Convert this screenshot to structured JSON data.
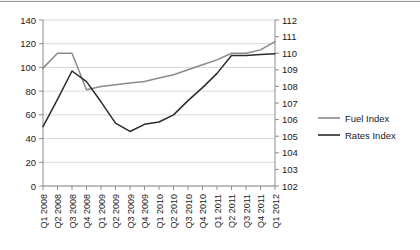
{
  "chart_data": {
    "type": "line",
    "title": "",
    "xlabel": "",
    "categories": [
      "Q1 2008",
      "Q2 2008",
      "Q3 2008",
      "Q4 2008",
      "Q1 2009",
      "Q2 2009",
      "Q3 2009",
      "Q4 2009",
      "Q1 2010",
      "Q2 2010",
      "Q3 2010",
      "Q4 2010",
      "Q1 2011",
      "Q2 2011",
      "Q3 2011",
      "Q4 2011",
      "Q1 2012"
    ],
    "grid": true,
    "legend_position": "right",
    "axes": {
      "left": {
        "label": "",
        "ylim": [
          0,
          140
        ],
        "step": 20,
        "ticks": [
          0,
          20,
          40,
          60,
          80,
          100,
          120,
          140
        ],
        "series": "Rates Index"
      },
      "right": {
        "label": "",
        "ylim": [
          102,
          112
        ],
        "step": 1,
        "ticks": [
          102,
          103,
          104,
          105,
          106,
          107,
          108,
          109,
          110,
          111,
          112
        ],
        "series": "Fuel Index"
      }
    },
    "series": [
      {
        "name": "Fuel Index",
        "axis": "right",
        "color": "#8a8a8a",
        "values": [
          109.1,
          110.0,
          110.0,
          107.8,
          108.0,
          108.1,
          108.2,
          108.3,
          108.5,
          108.7,
          109.0,
          109.3,
          109.6,
          110.0,
          110.0,
          110.2,
          110.7
        ]
      },
      {
        "name": "Rates Index",
        "axis": "left",
        "color": "#2b2b2b",
        "values": [
          50,
          73,
          97,
          88,
          71,
          53,
          46,
          52,
          54,
          60,
          72,
          83,
          95,
          110,
          110,
          111,
          111.5
        ]
      }
    ]
  },
  "legend": {
    "items": [
      {
        "label": "Fuel Index",
        "color": "#8a8a8a"
      },
      {
        "label": "Rates Index",
        "color": "#2b2b2b"
      }
    ]
  }
}
